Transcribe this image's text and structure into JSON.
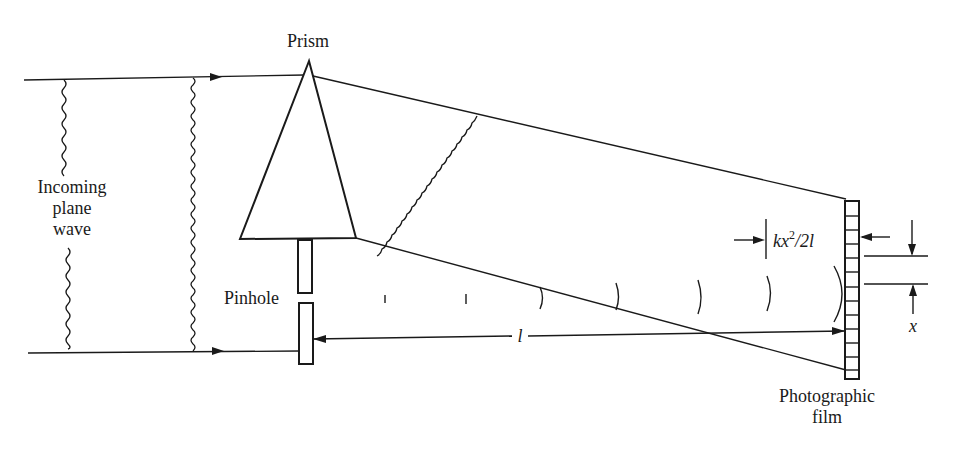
{
  "diagram": {
    "type": "optics-schematic",
    "colors": {
      "ink": "#1a1a1a",
      "background": "#ffffff"
    },
    "labels": {
      "prism": "Prism",
      "incoming": [
        "Incoming",
        "plane",
        "wave"
      ],
      "pinhole": "Pinhole",
      "film": [
        "Photographic",
        "film"
      ],
      "distance": "l",
      "offset_k": "kx",
      "offset_sup": "2",
      "offset_rest": "/2l",
      "height": "x"
    },
    "components": [
      {
        "name": "Incoming plane wave",
        "kind": "parallel rays with wavefronts"
      },
      {
        "name": "Prism",
        "kind": "triangle"
      },
      {
        "name": "Pinhole",
        "kind": "slit in screen"
      },
      {
        "name": "Photographic film",
        "kind": "segmented strip"
      }
    ],
    "annotations": [
      {
        "symbol": "l",
        "meaning": "distance pinhole to film"
      },
      {
        "symbol": "kx^2/2l",
        "meaning": "wavefront sag at film"
      },
      {
        "symbol": "x",
        "meaning": "transverse distance on film"
      }
    ]
  }
}
